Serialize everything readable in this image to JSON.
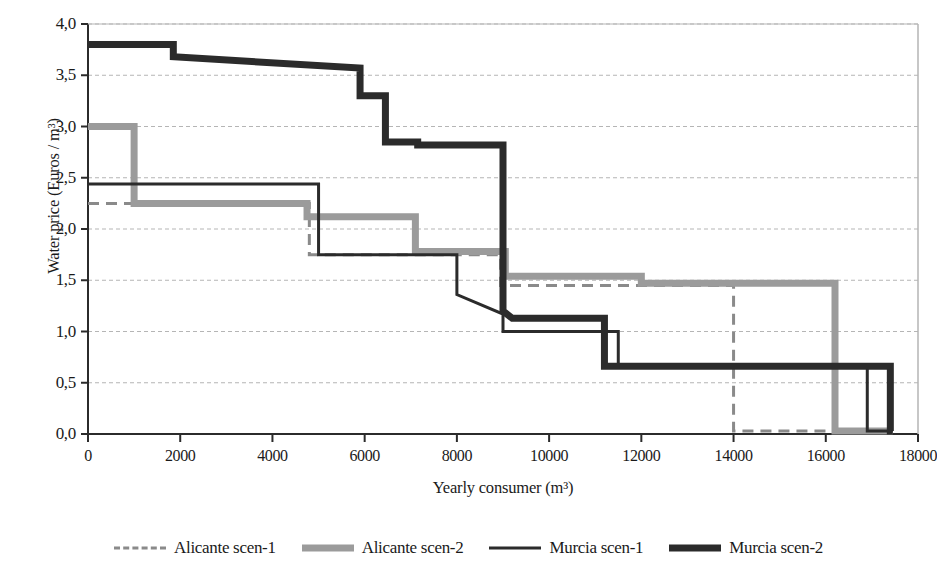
{
  "chart_data": {
    "type": "line",
    "title": "",
    "subtitle": "",
    "xlabel": "Yearly consumer (m³)",
    "ylabel": "Water price (Euros / m³)",
    "xlim": [
      0,
      18000
    ],
    "ylim": [
      0,
      4.0
    ],
    "xticks": [
      0,
      2000,
      4000,
      6000,
      8000,
      10000,
      12000,
      14000,
      16000,
      18000
    ],
    "xtick_labels": [
      "0",
      "2000",
      "4000",
      "6000",
      "8000",
      "10000",
      "12000",
      "14000",
      "16000",
      "18000"
    ],
    "yticks": [
      0.0,
      0.5,
      1.0,
      1.5,
      2.0,
      2.5,
      3.0,
      3.5,
      4.0
    ],
    "ytick_labels": [
      "0,0",
      "0,5",
      "1,0",
      "1,5",
      "2,0",
      "2,5",
      "3,0",
      "3,5",
      "4,0"
    ],
    "grid": "horizontal-dashed",
    "legend_position": "bottom",
    "decimal_separator": ",",
    "series": [
      {
        "name": "Alicante scen-1",
        "style": "dashed",
        "color": "#8a8a8a",
        "width": 3,
        "points": [
          [
            0,
            2.25
          ],
          [
            4800,
            2.25
          ],
          [
            4800,
            1.75
          ],
          [
            8950,
            1.75
          ],
          [
            8950,
            1.45
          ],
          [
            14000,
            1.45
          ],
          [
            14000,
            0.03
          ],
          [
            17450,
            0.03
          ]
        ]
      },
      {
        "name": "Alicante scen-2",
        "style": "solid",
        "color": "#9b9b9b",
        "width": 7,
        "points": [
          [
            0,
            3.0
          ],
          [
            1000,
            3.0
          ],
          [
            1000,
            2.25
          ],
          [
            4750,
            2.25
          ],
          [
            4750,
            2.12
          ],
          [
            7100,
            2.12
          ],
          [
            7100,
            1.78
          ],
          [
            9050,
            1.78
          ],
          [
            9050,
            1.54
          ],
          [
            12000,
            1.54
          ],
          [
            12000,
            1.47
          ],
          [
            16200,
            1.47
          ],
          [
            16200,
            0.03
          ],
          [
            17450,
            0.03
          ]
        ]
      },
      {
        "name": "Murcia scen-1",
        "style": "solid",
        "color": "#2b2b2b",
        "width": 3,
        "points": [
          [
            0,
            2.44
          ],
          [
            5000,
            2.44
          ],
          [
            5000,
            1.75
          ],
          [
            8000,
            1.75
          ],
          [
            8000,
            1.36
          ],
          [
            9000,
            1.17
          ],
          [
            9000,
            1.0
          ],
          [
            11500,
            1.0
          ],
          [
            11500,
            0.66
          ],
          [
            16900,
            0.66
          ],
          [
            16900,
            0.03
          ],
          [
            17450,
            0.03
          ]
        ]
      },
      {
        "name": "Murcia scen-2",
        "style": "solid",
        "color": "#2b2b2b",
        "width": 7,
        "points": [
          [
            0,
            3.8
          ],
          [
            1850,
            3.8
          ],
          [
            1850,
            3.68
          ],
          [
            5900,
            3.57
          ],
          [
            5900,
            3.3
          ],
          [
            6450,
            3.3
          ],
          [
            6450,
            2.85
          ],
          [
            7150,
            2.85
          ],
          [
            7150,
            2.82
          ],
          [
            9000,
            2.82
          ],
          [
            9000,
            1.2
          ],
          [
            9200,
            1.13
          ],
          [
            11200,
            1.13
          ],
          [
            11200,
            0.66
          ],
          [
            17400,
            0.66
          ],
          [
            17400,
            0.03
          ],
          [
            17450,
            0.03
          ]
        ]
      }
    ]
  },
  "legend": {
    "items": [
      {
        "label": "Alicante scen-1"
      },
      {
        "label": "Alicante scen-2"
      },
      {
        "label": "Murcia scen-1"
      },
      {
        "label": "Murcia scen-2"
      }
    ]
  },
  "colors": {
    "axis": "#2b2b2b",
    "grid": "#b5b5b5",
    "gray_series": "#9b9b9b",
    "dark_series": "#2b2b2b",
    "background": "#ffffff"
  }
}
